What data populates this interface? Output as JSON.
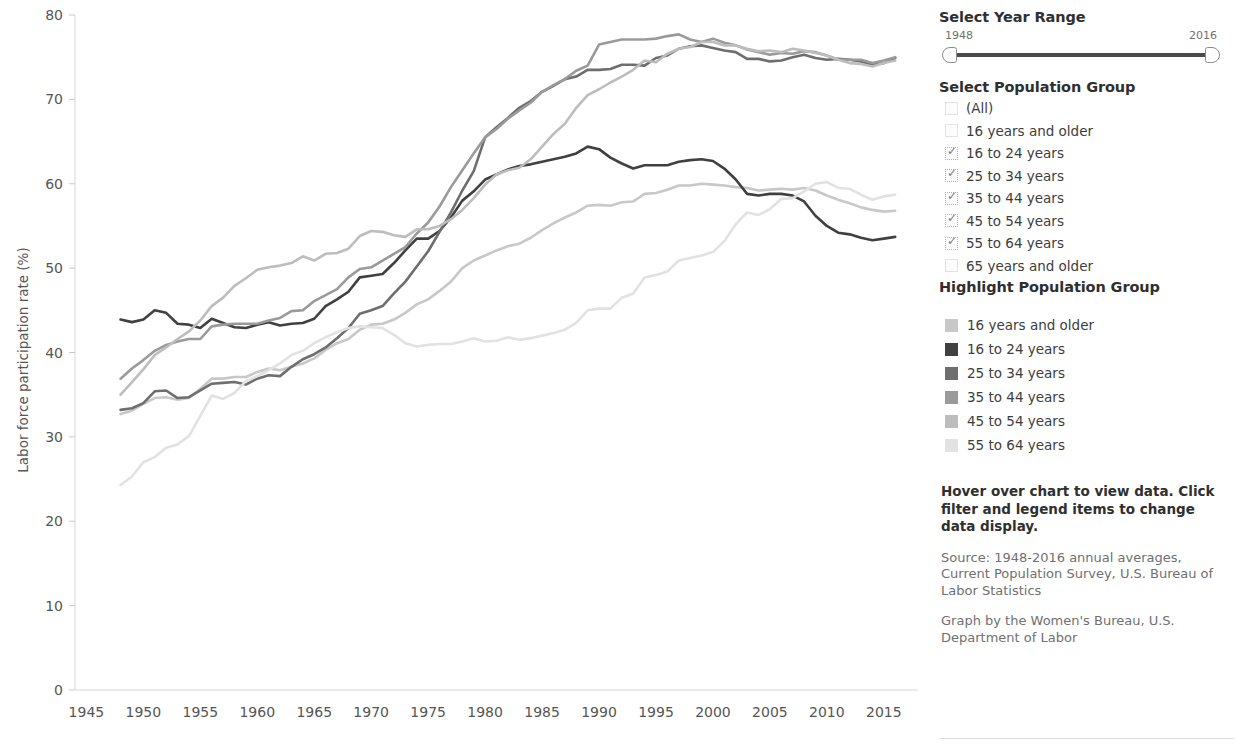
{
  "chart_data": {
    "type": "line",
    "title": "",
    "xlabel": "",
    "ylabel": "Labor force participation rate (%)",
    "xlim": [
      1944,
      2018
    ],
    "ylim": [
      0,
      80
    ],
    "xticks": [
      1945,
      1950,
      1955,
      1960,
      1965,
      1970,
      1975,
      1980,
      1985,
      1990,
      1995,
      2000,
      2005,
      2010,
      2015
    ],
    "yticks": [
      0,
      10,
      20,
      30,
      40,
      50,
      60,
      70,
      80
    ],
    "grid": false,
    "legend_position": "right",
    "x": [
      1948,
      1949,
      1950,
      1951,
      1952,
      1953,
      1954,
      1955,
      1956,
      1957,
      1958,
      1959,
      1960,
      1961,
      1962,
      1963,
      1964,
      1965,
      1966,
      1967,
      1968,
      1969,
      1970,
      1971,
      1972,
      1973,
      1974,
      1975,
      1976,
      1977,
      1978,
      1979,
      1980,
      1981,
      1982,
      1983,
      1984,
      1985,
      1986,
      1987,
      1988,
      1989,
      1990,
      1991,
      1992,
      1993,
      1994,
      1995,
      1996,
      1997,
      1998,
      1999,
      2000,
      2001,
      2002,
      2003,
      2004,
      2005,
      2006,
      2007,
      2008,
      2009,
      2010,
      2011,
      2012,
      2013,
      2014,
      2015,
      2016
    ],
    "series": [
      {
        "name": "16 years and older",
        "color": "#c8c8c8",
        "values": [
          32.7,
          33.1,
          33.9,
          34.6,
          34.7,
          34.4,
          34.6,
          35.7,
          36.9,
          36.9,
          37.1,
          37.1,
          37.7,
          38.1,
          37.9,
          38.3,
          38.7,
          39.3,
          40.3,
          41.1,
          41.6,
          42.7,
          43.3,
          43.4,
          43.9,
          44.7,
          45.7,
          46.3,
          47.3,
          48.4,
          50.0,
          50.9,
          51.5,
          52.1,
          52.6,
          52.9,
          53.6,
          54.5,
          55.3,
          56.0,
          56.6,
          57.4,
          57.5,
          57.4,
          57.8,
          57.9,
          58.8,
          58.9,
          59.3,
          59.8,
          59.8,
          60.0,
          59.9,
          59.8,
          59.6,
          59.5,
          59.2,
          59.3,
          59.4,
          59.3,
          59.5,
          59.2,
          58.6,
          58.1,
          57.7,
          57.2,
          56.9,
          56.7,
          56.8
        ]
      },
      {
        "name": "16 to 24 years",
        "color": "#404040",
        "values": [
          43.9,
          43.6,
          43.9,
          45.0,
          44.7,
          43.4,
          43.3,
          42.9,
          44.0,
          43.5,
          43.0,
          42.9,
          43.3,
          43.6,
          43.2,
          43.4,
          43.5,
          44.0,
          45.5,
          46.3,
          47.2,
          48.9,
          49.1,
          49.3,
          50.6,
          52.1,
          53.5,
          53.5,
          54.4,
          56.0,
          58.0,
          59.1,
          60.5,
          61.1,
          61.7,
          62.1,
          62.3,
          62.6,
          62.9,
          63.2,
          63.6,
          64.4,
          64.1,
          63.1,
          62.4,
          61.8,
          62.2,
          62.2,
          62.2,
          62.6,
          62.8,
          62.9,
          62.7,
          61.8,
          60.5,
          58.8,
          58.6,
          58.8,
          58.8,
          58.6,
          57.9,
          56.2,
          55.0,
          54.2,
          54.0,
          53.6,
          53.3,
          53.5,
          53.7
        ]
      },
      {
        "name": "25 to 34 years",
        "color": "#6e6e6e",
        "values": [
          33.2,
          33.4,
          34.0,
          35.4,
          35.5,
          34.6,
          34.7,
          35.5,
          36.3,
          36.4,
          36.5,
          36.2,
          36.9,
          37.3,
          37.2,
          38.3,
          39.2,
          39.8,
          40.6,
          41.7,
          42.9,
          44.6,
          45.0,
          45.5,
          47.0,
          48.4,
          50.2,
          52.0,
          54.3,
          56.6,
          59.2,
          61.5,
          65.5,
          66.7,
          67.8,
          69.0,
          69.8,
          70.9,
          71.6,
          72.4,
          72.7,
          73.5,
          73.5,
          73.6,
          74.1,
          74.1,
          74.0,
          74.9,
          75.2,
          76.0,
          76.3,
          76.4,
          76.1,
          75.8,
          75.6,
          74.8,
          74.8,
          74.5,
          74.6,
          75.0,
          75.3,
          74.9,
          74.7,
          74.8,
          74.7,
          74.5,
          74.1,
          74.3,
          74.9
        ]
      },
      {
        "name": "35 to 44 years",
        "color": "#9a9a9a",
        "values": [
          36.9,
          38.1,
          39.1,
          40.2,
          40.9,
          41.3,
          41.6,
          41.6,
          43.1,
          43.3,
          43.4,
          43.4,
          43.4,
          43.8,
          44.1,
          44.9,
          45.0,
          46.1,
          46.8,
          47.5,
          48.9,
          49.9,
          50.1,
          50.9,
          51.7,
          52.5,
          54.1,
          55.4,
          57.3,
          59.6,
          61.6,
          63.6,
          65.5,
          66.5,
          67.7,
          68.7,
          69.6,
          70.9,
          71.7,
          72.4,
          73.4,
          74.0,
          76.5,
          76.8,
          77.1,
          77.1,
          77.1,
          77.2,
          77.5,
          77.7,
          77.1,
          76.8,
          77.2,
          76.7,
          76.4,
          75.9,
          75.6,
          75.3,
          75.5,
          75.4,
          75.7,
          75.6,
          75.2,
          74.7,
          74.7,
          74.7,
          74.3,
          74.6,
          75.0
        ]
      },
      {
        "name": "45 to 54 years",
        "color": "#bdbdbd",
        "values": [
          35.0,
          36.5,
          38.0,
          39.7,
          40.6,
          41.6,
          42.5,
          43.8,
          45.5,
          46.5,
          47.9,
          48.8,
          49.8,
          50.1,
          50.3,
          50.6,
          51.4,
          50.9,
          51.7,
          51.8,
          52.3,
          53.8,
          54.4,
          54.3,
          53.9,
          53.7,
          54.6,
          54.6,
          55.0,
          55.8,
          56.9,
          58.3,
          59.9,
          61.1,
          61.6,
          61.9,
          62.9,
          64.4,
          65.9,
          67.1,
          69.0,
          70.5,
          71.2,
          72.0,
          72.7,
          73.5,
          74.6,
          74.4,
          75.4,
          76.0,
          76.2,
          76.8,
          76.8,
          76.4,
          76.4,
          76.0,
          75.7,
          75.8,
          75.6,
          76.0,
          75.8,
          75.5,
          75.2,
          74.7,
          74.3,
          74.2,
          73.9,
          74.3,
          74.6
        ]
      },
      {
        "name": "55 to 64 years",
        "color": "#e2e2e2",
        "values": [
          24.3,
          25.3,
          27.0,
          27.6,
          28.7,
          29.1,
          30.1,
          32.5,
          34.9,
          34.5,
          35.2,
          36.6,
          37.2,
          37.9,
          38.7,
          39.7,
          40.2,
          41.1,
          41.8,
          42.4,
          42.9,
          43.1,
          43.0,
          42.9,
          42.1,
          41.1,
          40.7,
          40.9,
          41.0,
          41.0,
          41.3,
          41.7,
          41.3,
          41.4,
          41.8,
          41.5,
          41.7,
          42.0,
          42.3,
          42.7,
          43.5,
          45.0,
          45.2,
          45.2,
          46.5,
          47.0,
          48.9,
          49.2,
          49.6,
          50.9,
          51.2,
          51.5,
          51.9,
          53.2,
          55.2,
          56.6,
          56.3,
          57.0,
          58.2,
          58.3,
          59.1,
          60.0,
          60.2,
          59.5,
          59.4,
          58.7,
          58.1,
          58.5,
          58.7
        ]
      }
    ]
  },
  "sidebar": {
    "year_range": {
      "heading": "Select Year Range",
      "min_label": "1948",
      "max_label": "2016"
    },
    "population_filter": {
      "heading": "Select Population Group",
      "items": [
        {
          "label": "(All)",
          "checked": false
        },
        {
          "label": "16 years and older",
          "checked": false
        },
        {
          "label": "16 to 24 years",
          "checked": true
        },
        {
          "label": "25 to 34 years",
          "checked": true
        },
        {
          "label": "35 to 44 years",
          "checked": true
        },
        {
          "label": "45 to 54 years",
          "checked": true
        },
        {
          "label": "55 to 64 years",
          "checked": true
        },
        {
          "label": "65 years and older",
          "checked": false
        }
      ]
    },
    "highlight": {
      "heading": "Highlight Population Group",
      "items": [
        {
          "label": "16 years and older",
          "color": "#c8c8c8"
        },
        {
          "label": "16 to 24 years",
          "color": "#404040"
        },
        {
          "label": "25 to 34 years",
          "color": "#6e6e6e"
        },
        {
          "label": "35 to 44 years",
          "color": "#9a9a9a"
        },
        {
          "label": "45 to 54 years",
          "color": "#bdbdbd"
        },
        {
          "label": "55 to 64 years",
          "color": "#e2e2e2"
        }
      ]
    },
    "notes": {
      "instruction": "Hover over chart to view data. Click filter and legend items to change data display.",
      "source": "Source: 1948-2016 annual averages, Current Population Survey, U.S. Bureau of Labor Statistics",
      "credit": "Graph by the Women's Bureau, U.S. Department of Labor"
    }
  }
}
